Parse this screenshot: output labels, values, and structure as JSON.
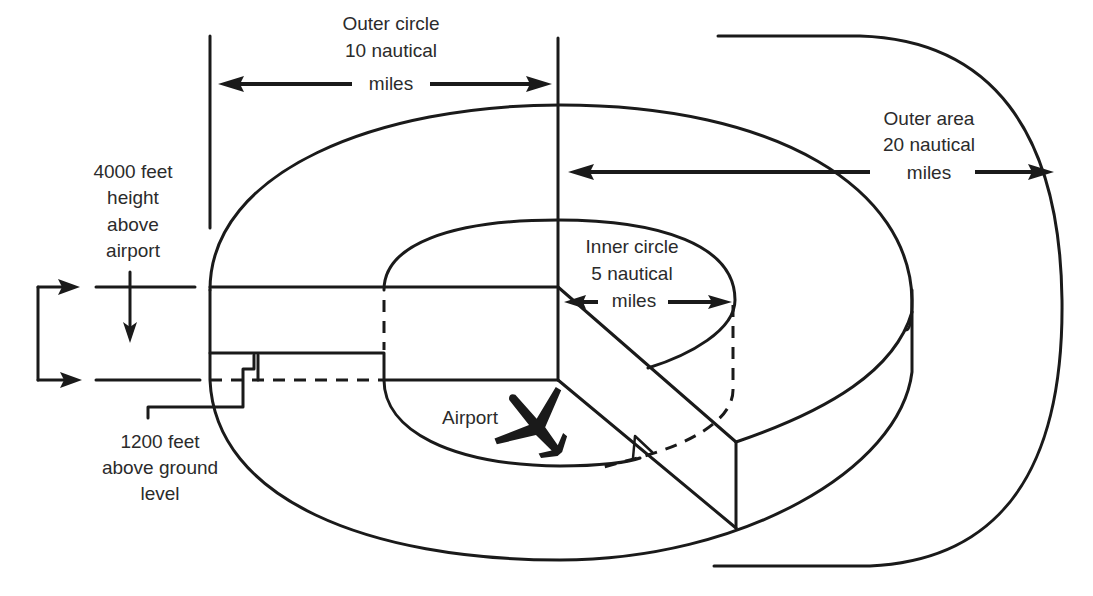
{
  "diagram": {
    "type": "airspace-class-c-schematic",
    "labels": {
      "outer_circle": [
        "Outer circle",
        "10 nautical",
        "miles"
      ],
      "outer_area": [
        "Outer area",
        "20 nautical",
        "miles"
      ],
      "inner_circle": [
        "Inner circle",
        "5 nautical",
        "miles"
      ],
      "upper_limit": [
        "4000 feet",
        "height",
        "above",
        "airport"
      ],
      "shelf_floor": [
        "1200 feet",
        "above ground",
        "level"
      ],
      "airport": "Airport"
    },
    "icons": {
      "airport": "airplane-icon"
    },
    "colors": {
      "line": "#1a1a1a",
      "text": "#2b2b2b",
      "background": "#ffffff"
    }
  }
}
